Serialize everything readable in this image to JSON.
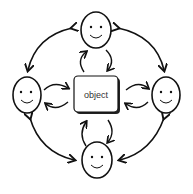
{
  "diagram": {
    "center": {
      "label": "object",
      "shape": "rounded-rectangle"
    },
    "nodes": [
      {
        "id": "top",
        "icon": "smiley-face-icon"
      },
      {
        "id": "left",
        "icon": "smiley-face-icon"
      },
      {
        "id": "right",
        "icon": "smiley-face-icon"
      },
      {
        "id": "bottom",
        "icon": "smiley-face-icon"
      }
    ],
    "connections": [
      {
        "from": "top",
        "to": "left",
        "type": "bidirectional-arc"
      },
      {
        "from": "top",
        "to": "right",
        "type": "bidirectional-arc"
      },
      {
        "from": "bottom",
        "to": "left",
        "type": "bidirectional-arc"
      },
      {
        "from": "bottom",
        "to": "right",
        "type": "bidirectional-arc"
      },
      {
        "from": "top",
        "to": "object",
        "type": "cycle-arrows"
      },
      {
        "from": "left",
        "to": "object",
        "type": "cycle-arrows"
      },
      {
        "from": "right",
        "to": "object",
        "type": "cycle-arrows"
      },
      {
        "from": "bottom",
        "to": "object",
        "type": "cycle-arrows"
      }
    ],
    "colors": {
      "stroke": "#111111",
      "fill": "#ffffff",
      "text": "#333333"
    }
  }
}
